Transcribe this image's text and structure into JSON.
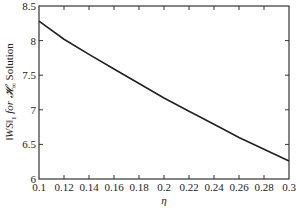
{
  "chart_data": {
    "type": "line",
    "title": "",
    "xlabel": "η",
    "ylabel": "‖WS‖₁ for 𝓗∞ Solution",
    "xlim": [
      0.1,
      0.3
    ],
    "ylim": [
      6,
      8.5
    ],
    "grid": false,
    "legend": null,
    "x_ticks": [
      "0.1",
      "0.12",
      "0.14",
      "0.16",
      "0.18",
      "0.2",
      "0.22",
      "0.24",
      "0.26",
      "0.28",
      "0.3"
    ],
    "y_ticks": [
      "6",
      "6.5",
      "7",
      "7.5",
      "8",
      "8.5"
    ],
    "x": [
      0.1,
      0.12,
      0.14,
      0.16,
      0.18,
      0.2,
      0.22,
      0.24,
      0.26,
      0.28,
      0.3
    ],
    "series": [
      {
        "name": "‖WS‖₁",
        "values": [
          8.28,
          8.02,
          7.8,
          7.59,
          7.38,
          7.17,
          6.98,
          6.79,
          6.6,
          6.43,
          6.26
        ]
      }
    ]
  },
  "labels": {
    "x_axis": "η",
    "y_axis_main": "‖WS‖",
    "y_axis_sub": "1",
    "y_axis_rest": " for ",
    "y_axis_h": "𝓗",
    "y_axis_hsub": "∞",
    "y_axis_end": " Solution"
  }
}
